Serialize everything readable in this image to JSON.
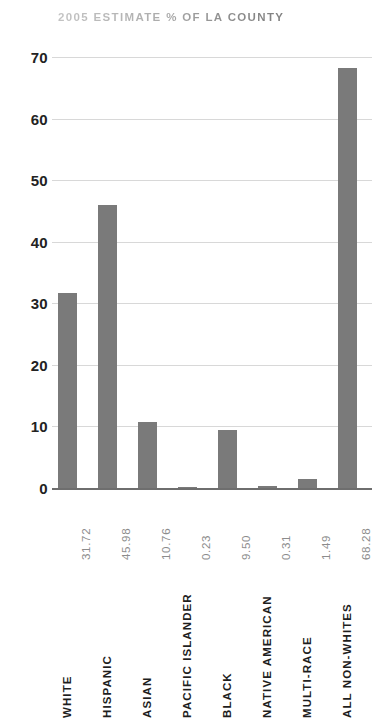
{
  "chart_data": {
    "type": "bar",
    "title": "2005 ESTIMATE % OF LA COUNTY",
    "xlabel": "",
    "ylabel": "",
    "ylim": [
      0,
      70
    ],
    "yticks": [
      70,
      60,
      50,
      40,
      30,
      20,
      10,
      0
    ],
    "grid": true,
    "legend": "none",
    "orientation": "vertical",
    "categories": [
      "WHITE",
      "HISPANIC",
      "ASIAN",
      "PACIFIC ISLANDER",
      "BLACK",
      "NATIVE AMERICAN",
      "MULTI-RACE",
      "ALL NON-WHITES"
    ],
    "values": [
      31.72,
      45.98,
      10.76,
      0.23,
      9.5,
      0.31,
      1.49,
      68.28
    ],
    "value_labels": [
      "31.72",
      "45.98",
      "10.76",
      "0.23",
      "9.50",
      "0.31",
      "1.49",
      "68.28"
    ],
    "colors": {
      "bar": "#7a7a7a",
      "gridline": "#d8d8d8",
      "baseline": "#6e6e6e",
      "title": "#a8a8a8",
      "ytick": "#232323",
      "value_label": "#8c8c8c",
      "category_label": "#1e1e1e",
      "background": "#ffffff"
    }
  }
}
